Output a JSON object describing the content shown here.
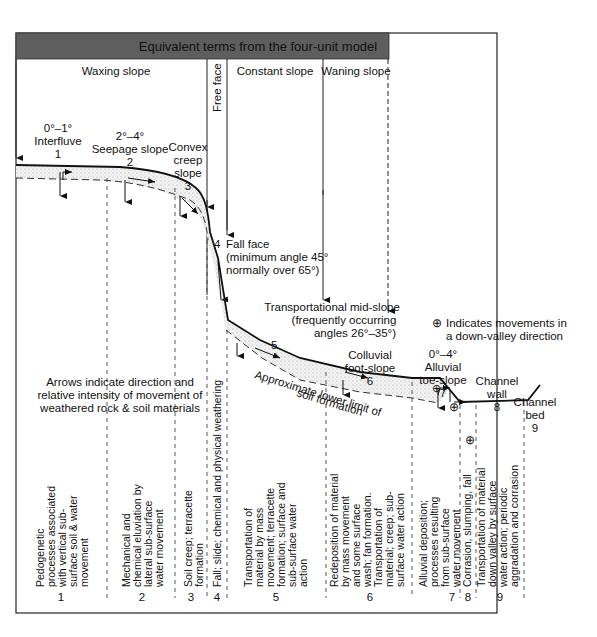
{
  "header": {
    "title": "Equivalent terms from the four-unit model",
    "bg_color": "#5e5e5e",
    "units": [
      {
        "label": "Waxing slope"
      },
      {
        "label": "Free face"
      },
      {
        "label": "Constant slope"
      },
      {
        "label": "Waning slope"
      }
    ]
  },
  "slope_units": [
    {
      "number": "1",
      "angle": "0°–1°",
      "name": "Interfluve",
      "process": [
        "Pedogenetic",
        "processes associated",
        "with vertical sub-",
        "surface soil & water",
        "movement"
      ]
    },
    {
      "number": "2",
      "angle": "2°–4°",
      "name": "Seepage slope",
      "process": [
        "Mechanical and",
        "chemical eluviation by",
        "lateral sub-surface",
        "water movement"
      ]
    },
    {
      "number": "3",
      "name_lines": [
        "Convex",
        "creep",
        "slope"
      ],
      "process": [
        "Soil creep; terracette",
        "formation"
      ]
    },
    {
      "number": "4",
      "name": "Fall face",
      "note_lines": [
        "(minimum angle 45°",
        "normally over 65°)"
      ],
      "process": [
        "Fall; slide; chemical and physical weathering"
      ]
    },
    {
      "number": "5",
      "name": "Transportational mid-slope",
      "note_lines": [
        "(frequently occurring",
        "angles 26°–35°)"
      ],
      "process": [
        "Transportation of",
        "material by mass",
        "movement; terracette",
        "formation; surface and",
        "sub-surface water",
        "action"
      ]
    },
    {
      "number": "6",
      "name_lines": [
        "Colluvial",
        "foot-slope"
      ],
      "process": [
        "Redeposition of material",
        "by mass movement",
        "and some surface",
        "wash; fan formation.",
        "Transportation of",
        "material; creep; sub-",
        "surface water action"
      ]
    },
    {
      "number": "7",
      "angle": "0°–4°",
      "name_lines": [
        "Alluvial",
        "toe-slope"
      ],
      "process": [
        "Alluvial deposition;",
        "processes resulting",
        "from sub-surface",
        "water movement"
      ]
    },
    {
      "number": "8",
      "name_lines": [
        "Channel",
        "wall"
      ],
      "process": [
        "Corrasion, slumping, fall"
      ]
    },
    {
      "number": "9",
      "name_lines": [
        "Channel",
        "bed"
      ],
      "process": [
        "Transportation of material",
        "down valley by surface",
        "water action; periodic",
        "aggradation and corrasion"
      ]
    }
  ],
  "annotations": {
    "arrows_note": [
      "Arrows indicate direction and",
      "relative intensity of movement of",
      "weathered rock & soil materials"
    ],
    "soil_limit": [
      "Approximate lower limit of",
      "soil formation"
    ],
    "down_valley_legend": [
      "Indicates movements in",
      "a down-valley direction"
    ],
    "down_valley_symbol": "⊕"
  }
}
